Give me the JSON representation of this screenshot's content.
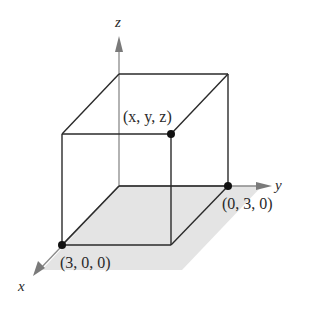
{
  "figure": {
    "type": "3d-box-coordinate-diagram",
    "axes": {
      "x": {
        "label": "x"
      },
      "y": {
        "label": "y"
      },
      "z": {
        "label": "z"
      }
    },
    "points": [
      {
        "id": "general",
        "label": "(x, y, z)"
      },
      {
        "id": "on-y-axis",
        "label": "(0, 3, 0)"
      },
      {
        "id": "on-x-axis",
        "label": "(3, 0, 0)"
      }
    ],
    "shaded_region": "xy-plane",
    "colors": {
      "line": "#2a2a2a",
      "axis": "#808080",
      "shade": "#e3e3e3",
      "point": "#111111"
    }
  }
}
